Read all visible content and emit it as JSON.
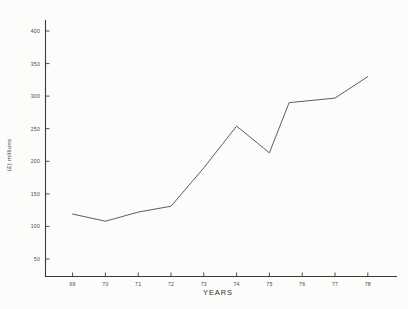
{
  "chart_data": {
    "type": "line",
    "title": "",
    "subtitle": "",
    "xlabel": "YEARS",
    "ylabel": "(£) millions",
    "x": [
      69,
      70,
      71,
      72,
      73,
      74,
      75,
      75.6,
      77,
      78
    ],
    "categories": [
      "69",
      "70",
      "71",
      "72",
      "73",
      "74",
      "75",
      "76",
      "77",
      "78"
    ],
    "values": [
      119,
      108,
      122,
      131,
      190,
      254,
      213,
      290,
      297,
      330
    ],
    "series": [
      {
        "name": "value",
        "values": [
          119,
          108,
          122,
          131,
          190,
          254,
          213,
          290,
          297,
          330
        ]
      }
    ],
    "xlim": [
      68.4,
      78.6
    ],
    "ylim": [
      28,
      420
    ],
    "yticks": [
      50,
      100,
      150,
      200,
      250,
      300,
      350,
      400
    ],
    "ytick_labels": [
      "50",
      "100",
      "150",
      "200",
      "250",
      "300",
      "350",
      "400"
    ],
    "xticks": [
      69,
      70,
      71,
      72,
      73,
      74,
      75,
      76,
      77,
      78
    ],
    "xtick_labels": [
      "69",
      "70",
      "71",
      "72",
      "73",
      "74",
      "75",
      "76",
      "77",
      "78"
    ],
    "grid": false,
    "legend": false,
    "legend_position": "none",
    "line_color": "#555555",
    "axis_color": "#3a3a3a",
    "background_color": "#fcfcfb",
    "annotations": []
  },
  "axes": {
    "y_axis_title": "(£) millions",
    "x_axis_title": "YEARS"
  }
}
